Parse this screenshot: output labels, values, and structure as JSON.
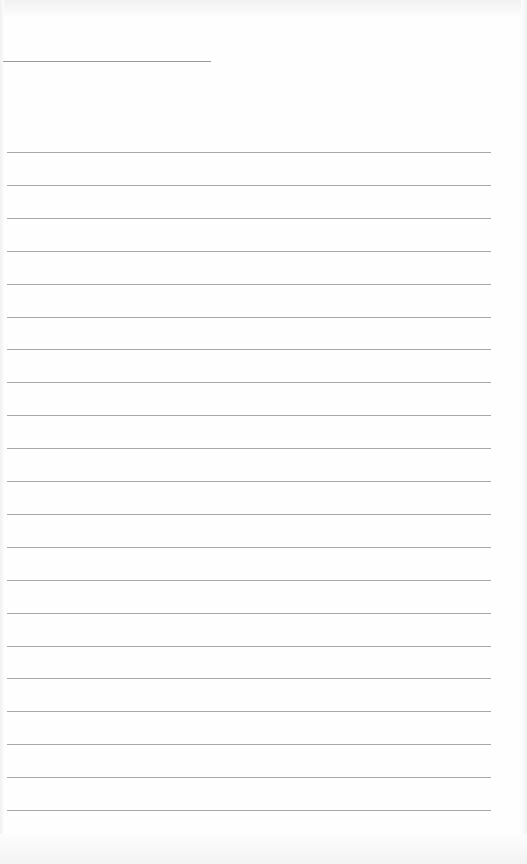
{
  "page": {
    "type": "lined-paper",
    "background": "#fefefe",
    "line_color": "#a8a8a8"
  },
  "header": {
    "name_line": {
      "x": 3,
      "y": 61,
      "width": 208
    }
  },
  "rules": {
    "count": 21,
    "first_y": 152,
    "spacing": 32.9,
    "x": 7,
    "width": 484
  }
}
